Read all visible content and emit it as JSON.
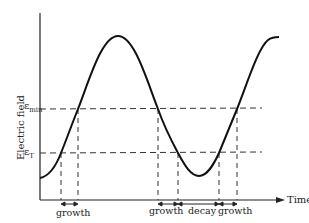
{
  "diagram": {
    "y_axis_label": "Electric field",
    "x_axis_label": "Time",
    "levels": [
      {
        "symbol": "ε",
        "subscript": "min",
        "name": "epsilon-min"
      },
      {
        "symbol": "ε",
        "subscript": "T",
        "name": "epsilon-T"
      }
    ],
    "intervals": [
      {
        "label": "growth"
      },
      {
        "label": "growth"
      },
      {
        "label": "decay"
      },
      {
        "label": "growth"
      }
    ],
    "curve_description": "Oscillating electric field vs time, crossing threshold levels ε_T and ε_min"
  }
}
